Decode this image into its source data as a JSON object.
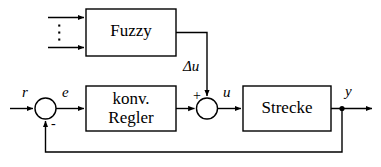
{
  "diagram": {
    "kind": "control-block-diagram",
    "language": "de",
    "background_color": "#ffffff",
    "line_color": "#000000",
    "blocks": [
      {
        "id": "fuzzy",
        "label": "Fuzzy",
        "x": 86,
        "y": 9,
        "width": 90,
        "height": 47
      },
      {
        "id": "regler",
        "label": "konv.\nRegler",
        "x": 86,
        "y": 86,
        "width": 90,
        "height": 45
      },
      {
        "id": "strecke",
        "label": "Strecke",
        "x": 243,
        "y": 86,
        "width": 88,
        "height": 45
      }
    ],
    "summing_junctions": [
      {
        "id": "sum-error",
        "cx": 45.5,
        "cy": 108.5,
        "r": 10.5,
        "sign": "-",
        "sign_position": "bottom-right"
      },
      {
        "id": "sum-control",
        "cx": 207,
        "cy": 108.5,
        "r": 10.5,
        "sign": "+",
        "sign_position": "top-left"
      }
    ],
    "signal_labels": {
      "reference": "r",
      "error": "e",
      "fuzzy_output": "Δu",
      "control": "u",
      "plant_output": "y"
    },
    "signs": {
      "feedback_sign": "-",
      "fuzzy_sum_sign": "+"
    },
    "fuzzy_inputs": {
      "count_shown": 2,
      "ellipsis_glyph": "⋮",
      "description": "two arrows into Fuzzy block with vertical dots between them"
    },
    "junction_dots": [
      {
        "id": "feedback-tap",
        "cx": 342,
        "cy": 108.5
      }
    ]
  }
}
